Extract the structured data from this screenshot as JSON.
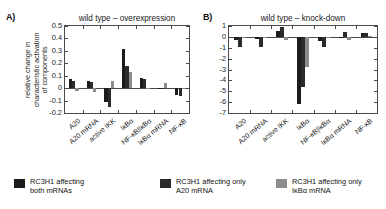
{
  "figure": {
    "panels": [
      {
        "letter": "A)",
        "title": "wild type – overexpression",
        "ylabel": "relative change in\ncharacteristic activation\nof components"
      },
      {
        "letter": "B)",
        "title": "wild type – knock-down",
        "ylabel": ""
      }
    ]
  },
  "legend": {
    "items": [
      {
        "label": "RC3H1 affecting\nboth mRNAs",
        "color": "#1c1c1c",
        "name": "both-mrnas"
      },
      {
        "label": "RC3H1 affecting only\nA20 mRNA",
        "color": "#2b2b2b",
        "name": "a20-mrna"
      },
      {
        "label": "RC3H1 affecting only\nIκBα mRNA",
        "color": "#8c8c8c",
        "name": "ikba-mrna"
      }
    ]
  },
  "chart_data": [
    {
      "type": "bar",
      "panel": "A",
      "title": "wild type – overexpression",
      "xlabel": "",
      "ylabel": "relative change in characteristic activation of components",
      "ylim": [
        -0.2,
        0.5
      ],
      "yticks": [
        -0.2,
        -0.1,
        0,
        0.1,
        0.2,
        0.3,
        0.4,
        0.5
      ],
      "ytick_labels": [
        "-0.2",
        "-0.1",
        "0",
        "0.1",
        "0.2",
        "0.3",
        "0.4",
        "0.5"
      ],
      "grid": false,
      "legend_position": "below-figure",
      "categories": [
        "A20",
        "A20 mRNA",
        "active IKK",
        "IκBα",
        "NF-κB|IκBα",
        "IκBα mRNA",
        "NF-κB"
      ],
      "series": [
        {
          "name": "RC3H1 affecting both mRNAs",
          "color": "#1c1c1c",
          "values": [
            0.07,
            0.06,
            -0.11,
            0.315,
            0.08,
            0.005,
            -0.055
          ]
        },
        {
          "name": "RC3H1 affecting only A20 mRNA",
          "color": "#2b2b2b",
          "values": [
            0.055,
            0.05,
            -0.15,
            0.18,
            0.075,
            -0.005,
            -0.06
          ]
        },
        {
          "name": "RC3H1 affecting only IκBα mRNA",
          "color": "#8c8c8c",
          "values": [
            -0.025,
            -0.03,
            0.06,
            0.13,
            -0.01,
            0.04,
            -0.005
          ]
        }
      ]
    },
    {
      "type": "bar",
      "panel": "B",
      "title": "wild type – knock-down",
      "xlabel": "",
      "ylabel": "",
      "ylim": [
        -7,
        1
      ],
      "yticks": [
        -7,
        -6,
        -5,
        -4,
        -3,
        -2,
        -1,
        0,
        1
      ],
      "ytick_labels": [
        "-7",
        "-6",
        "-5",
        "-4",
        "-3",
        "-2",
        "-1",
        "0",
        "1"
      ],
      "grid": false,
      "legend_position": "below-figure",
      "categories": [
        "A20",
        "A20 mRNA",
        "active IKK",
        "IκBα",
        "NF-κB|IκBα",
        "IκBα mRNA",
        "NF-κB"
      ],
      "series": [
        {
          "name": "RC3H1 affecting both mRNAs",
          "color": "#1c1c1c",
          "values": [
            -0.25,
            -0.18,
            0.55,
            -6.2,
            -0.35,
            -0.12,
            0.32
          ]
        },
        {
          "name": "RC3H1 affecting only A20 mRNA",
          "color": "#2b2b2b",
          "values": [
            -0.95,
            -0.95,
            0.95,
            -4.6,
            -0.9,
            0.45,
            0.4
          ]
        },
        {
          "name": "RC3H1 affecting only IκBα mRNA",
          "color": "#8c8c8c",
          "values": [
            -0.1,
            -0.08,
            -0.3,
            -2.75,
            -0.1,
            -0.3,
            0.05
          ]
        }
      ]
    }
  ]
}
